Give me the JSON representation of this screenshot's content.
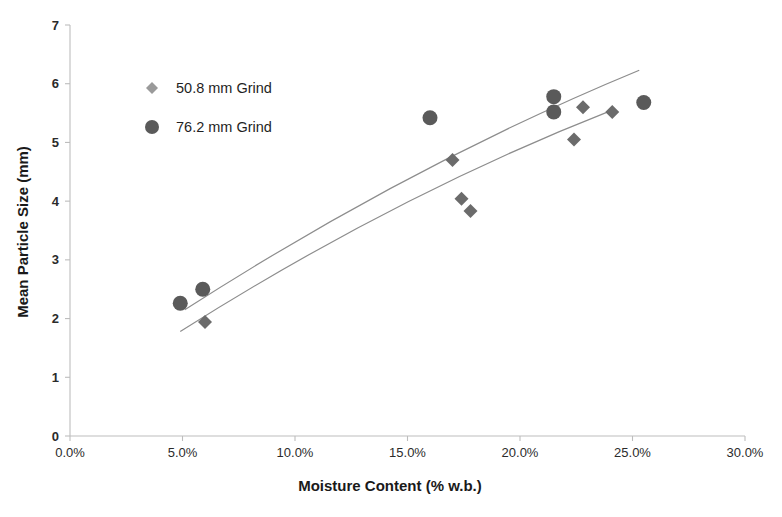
{
  "chart_data": {
    "type": "scatter",
    "title": "",
    "xlabel": "Moisture Content (% w.b.)",
    "ylabel": "Mean Particle Size (mm)",
    "xlim": [
      0,
      30
    ],
    "ylim": [
      0,
      7
    ],
    "xtick_labels": [
      "0.0%",
      "5.0%",
      "10.0%",
      "15.0%",
      "20.0%",
      "25.0%",
      "30.0%"
    ],
    "xtick_values": [
      0,
      5,
      10,
      15,
      20,
      25,
      30
    ],
    "ytick_labels": [
      "0",
      "1",
      "2",
      "3",
      "4",
      "5",
      "6",
      "7"
    ],
    "ytick_values": [
      0,
      1,
      2,
      3,
      4,
      5,
      6,
      7
    ],
    "grid": false,
    "legend_position": "upper-left-inside",
    "series": [
      {
        "name": "50.8 mm Grind",
        "marker": "diamond",
        "color": "#6b6b6b",
        "points": [
          {
            "x": 6.0,
            "y": 1.94
          },
          {
            "x": 17.0,
            "y": 4.7
          },
          {
            "x": 17.4,
            "y": 4.04
          },
          {
            "x": 17.8,
            "y": 3.83
          },
          {
            "x": 22.4,
            "y": 5.05
          },
          {
            "x": 22.8,
            "y": 5.6
          },
          {
            "x": 24.1,
            "y": 5.52
          }
        ],
        "trendline": {
          "x_start": 4.9,
          "x_end": 24.1,
          "y_start": 1.78,
          "y_end": 5.55
        }
      },
      {
        "name": "76.2 mm Grind",
        "marker": "circle",
        "color": "#5a5a5a",
        "points": [
          {
            "x": 4.9,
            "y": 2.26
          },
          {
            "x": 5.9,
            "y": 2.5
          },
          {
            "x": 16.0,
            "y": 5.42
          },
          {
            "x": 21.5,
            "y": 5.78
          },
          {
            "x": 21.5,
            "y": 5.52
          },
          {
            "x": 25.5,
            "y": 5.68
          }
        ],
        "trendline": {
          "x_start": 5.1,
          "x_end": 25.3,
          "y_start": 2.15,
          "y_end": 6.23
        }
      }
    ]
  },
  "legend": {
    "items": [
      {
        "label": "50.8 mm Grind",
        "marker": "diamond"
      },
      {
        "label": "76.2 mm Grind",
        "marker": "circle"
      }
    ]
  },
  "colors": {
    "marker": "#5a5a5a",
    "diamond": "#6b6b6b",
    "trend": "#8d8d8d",
    "axis": "#bdbdbd",
    "text": "#1a1a1a",
    "background": "#ffffff"
  }
}
